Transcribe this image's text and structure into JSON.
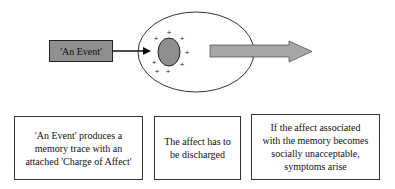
{
  "diagram": {
    "event_label": "'An Event'",
    "colors": {
      "event_box_fill": "#8f8f8f",
      "memory_trace_fill": "#8f8f8f",
      "outflow_arrow_fill": "#a6a6a6",
      "outline": "#222222"
    },
    "charge_symbols": [
      "+",
      "+",
      "+",
      "+",
      "+",
      "+",
      "+",
      "+"
    ],
    "boxes": [
      {
        "lines": [
          "'An Event' produces a",
          "memory trace with an",
          "attached 'Charge of Affect'"
        ]
      },
      {
        "lines": [
          "The affect has to",
          "be discharged"
        ]
      },
      {
        "lines": [
          "If the affect associated",
          "with the memory becomes",
          "socially unacceptable,",
          "symptoms arise"
        ]
      }
    ]
  }
}
